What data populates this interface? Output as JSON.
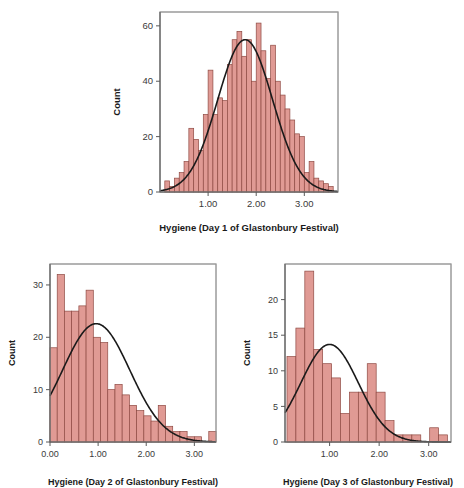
{
  "figure": {
    "background": "#ffffff",
    "bar_fill": "#e09a94",
    "bar_stroke": "#8f4a43",
    "curve_color": "#1a1a1a",
    "frame_color": "#9a9a9a",
    "axis_color": "#5a5a5a"
  },
  "chart_data": [
    {
      "type": "bar",
      "id": "day1",
      "title": "",
      "xlabel": "Hygiene (Day 1 of Glastonbury Festival)",
      "ylabel": "Count",
      "xlim": [
        0.0,
        3.7
      ],
      "ylim": [
        0,
        65
      ],
      "xticks": [
        1.0,
        2.0,
        3.0
      ],
      "xtick_labels": [
        "1.00",
        "2.00",
        "3.00"
      ],
      "yticks": [
        0,
        20,
        40,
        60
      ],
      "ytick_labels": [
        "0",
        "20",
        "40",
        "60"
      ],
      "grid": false,
      "legend": "none",
      "bin_width": 0.1,
      "bin_starts": [
        0.1,
        0.2,
        0.3,
        0.4,
        0.5,
        0.6,
        0.7,
        0.8,
        0.9,
        1.0,
        1.1,
        1.2,
        1.3,
        1.4,
        1.5,
        1.6,
        1.7,
        1.8,
        1.9,
        2.0,
        2.1,
        2.2,
        2.3,
        2.4,
        2.5,
        2.6,
        2.7,
        2.8,
        2.9,
        3.0,
        3.1,
        3.2,
        3.3,
        3.4,
        3.5
      ],
      "values": [
        4,
        2,
        5,
        7,
        11,
        23,
        19,
        15,
        28,
        44,
        28,
        34,
        33,
        46,
        55,
        58,
        49,
        55,
        40,
        61,
        51,
        41,
        53,
        40,
        35,
        30,
        26,
        21,
        20,
        7,
        11,
        5,
        4,
        3,
        2
      ],
      "curve": {
        "label": "normal-distribution-curve",
        "mean": 1.77,
        "sd": 0.57,
        "peak": 55
      }
    },
    {
      "type": "bar",
      "id": "day2",
      "title": "",
      "xlabel": "Hygiene (Day 2 of Glastonbury Festival)",
      "ylabel": "Count",
      "xlim": [
        0.0,
        3.45
      ],
      "ylim": [
        0,
        34
      ],
      "xticks": [
        0.0,
        1.0,
        2.0,
        3.0
      ],
      "xtick_labels": [
        "0.00",
        "1.00",
        "2.00",
        "3.00"
      ],
      "yticks": [
        0,
        10,
        20,
        30
      ],
      "ytick_labels": [
        "0",
        "10",
        "20",
        "30"
      ],
      "grid": false,
      "legend": "none",
      "bin_width": 0.15,
      "bin_starts": [
        0.0,
        0.15,
        0.3,
        0.45,
        0.6,
        0.75,
        0.9,
        1.05,
        1.2,
        1.35,
        1.5,
        1.65,
        1.8,
        1.95,
        2.1,
        2.25,
        2.4,
        2.55,
        2.7,
        2.85,
        3.0,
        3.15,
        3.3
      ],
      "values": [
        18,
        32,
        25,
        25,
        26,
        29,
        20,
        19,
        10,
        11,
        9,
        7,
        6,
        5,
        4,
        7,
        3,
        2,
        2,
        1,
        1,
        0,
        2
      ],
      "curve": {
        "label": "normal-distribution-curve",
        "mean": 0.96,
        "sd": 0.7,
        "peak": 22.6
      }
    },
    {
      "type": "bar",
      "id": "day3",
      "title": "",
      "xlabel": "Hygiene (Day 3 of Glastonbury Festival)",
      "ylabel": "Count",
      "xlim": [
        0.1,
        3.45
      ],
      "ylim": [
        0,
        25
      ],
      "xticks": [
        1.0,
        2.0,
        3.0
      ],
      "xtick_labels": [
        "1.00",
        "2.00",
        "3.00"
      ],
      "yticks": [
        0,
        5,
        10,
        15,
        20
      ],
      "ytick_labels": [
        "0",
        "5",
        "10",
        "15",
        "20"
      ],
      "grid": false,
      "legend": "none",
      "bin_width": 0.18,
      "bin_starts": [
        0.14,
        0.32,
        0.5,
        0.68,
        0.86,
        1.04,
        1.22,
        1.4,
        1.58,
        1.76,
        1.94,
        2.12,
        2.3,
        2.48,
        2.66,
        2.84,
        3.02,
        3.2
      ],
      "values": [
        12,
        16,
        24,
        13,
        11,
        9,
        4,
        7,
        7,
        11,
        7,
        3,
        1,
        1,
        1,
        0,
        2,
        1
      ],
      "curve": {
        "label": "normal-distribution-curve",
        "mean": 1.0,
        "sd": 0.58,
        "peak": 13.7
      }
    }
  ]
}
